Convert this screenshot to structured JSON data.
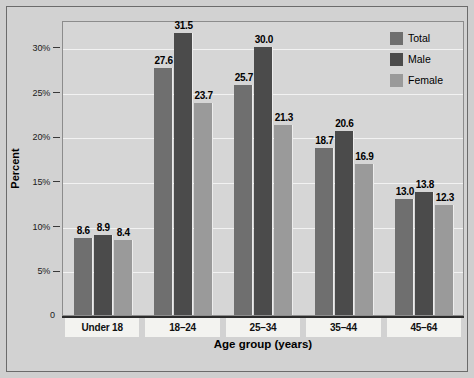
{
  "chart_data": {
    "type": "bar",
    "title": "",
    "xlabel": "Age group (years)",
    "ylabel": "Percent",
    "categories": [
      "Under 18",
      "18–24",
      "25–34",
      "35–44",
      "45–64"
    ],
    "series": [
      {
        "name": "Total",
        "color": "#6f6f6f",
        "values": [
          8.6,
          27.6,
          25.7,
          18.7,
          13.0
        ]
      },
      {
        "name": "Male",
        "color": "#4b4b4b",
        "values": [
          8.9,
          31.5,
          30.0,
          20.6,
          13.8
        ]
      },
      {
        "name": "Female",
        "color": "#9a9a9a",
        "values": [
          8.4,
          23.7,
          21.3,
          16.9,
          12.3
        ]
      }
    ],
    "ylim": [
      0,
      33
    ],
    "yticks": [
      0,
      5,
      10,
      15,
      20,
      25,
      30
    ],
    "ytick_labels": [
      "0",
      "5%",
      "10%",
      "15%",
      "20%",
      "25%",
      "30%"
    ],
    "grid": "horizontal",
    "legend_position": "top-right",
    "value_labels": true
  },
  "axes": {
    "y_title": "Percent",
    "x_title": "Age group (years)",
    "zero_label": "0"
  },
  "legend": {
    "items": [
      {
        "label": "Total"
      },
      {
        "label": "Male"
      },
      {
        "label": "Female"
      }
    ]
  }
}
